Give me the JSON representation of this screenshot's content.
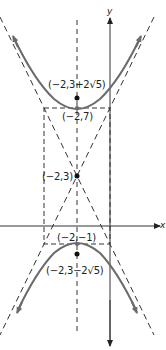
{
  "diagram": {
    "type": "hyperbola",
    "colors": {
      "curve": "#6b6b6b",
      "axis": "#333333",
      "dashed": "#333333",
      "point": "#111111",
      "text": "#222222"
    },
    "axes": {
      "x_label": "x",
      "y_label": "y"
    },
    "labels": {
      "focus_top": "(−2,3+2√5)",
      "vertex_top": "(−2,7)",
      "center": "(−2,3)",
      "vertex_bottom": "(−2,−1)",
      "focus_bottom": "(−2,3−2√5)"
    },
    "points": {
      "center": [
        -2,
        3
      ],
      "vertex_top": [
        -2,
        7
      ],
      "vertex_bottom": [
        -2,
        -1
      ],
      "focus_top": "(-2, 3+2√5)",
      "focus_bottom": "(-2, 3-2√5)"
    },
    "elements": [
      "upper branch",
      "lower branch",
      "two dashed asymptotes",
      "dashed fundamental rectangle",
      "dashed transverse axis x=-2"
    ]
  }
}
